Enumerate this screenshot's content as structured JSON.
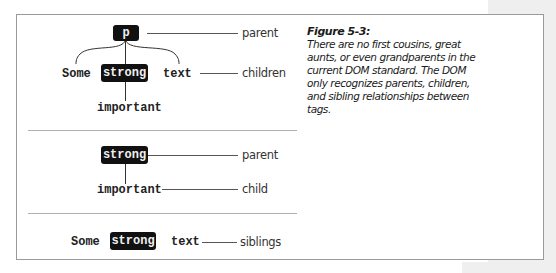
{
  "figure": {
    "title": "Figure 5-3:",
    "caption": "There are no first cousins, great aunts, or even grandparents in the current DOM standard. The DOM only recognizes parents, children, and sibling relationships between tags."
  },
  "diagrams": {
    "tree": {
      "root_tag": "p",
      "children": [
        "Some",
        "strong",
        "text"
      ],
      "grandchild": "important",
      "labels": {
        "parent": "parent",
        "children": "children"
      }
    },
    "parent_child": {
      "parent_tag": "strong",
      "child": "important",
      "labels": {
        "parent": "parent",
        "child": "child"
      }
    },
    "siblings": {
      "nodes": [
        "Some",
        "strong",
        "text"
      ],
      "labels": {
        "siblings": "siblings"
      }
    }
  },
  "colors": {
    "tag_box_bg": "#111111",
    "tag_box_text": "#f0f0f0",
    "border": "#9a9a9a",
    "margin_band": "#efefef"
  }
}
